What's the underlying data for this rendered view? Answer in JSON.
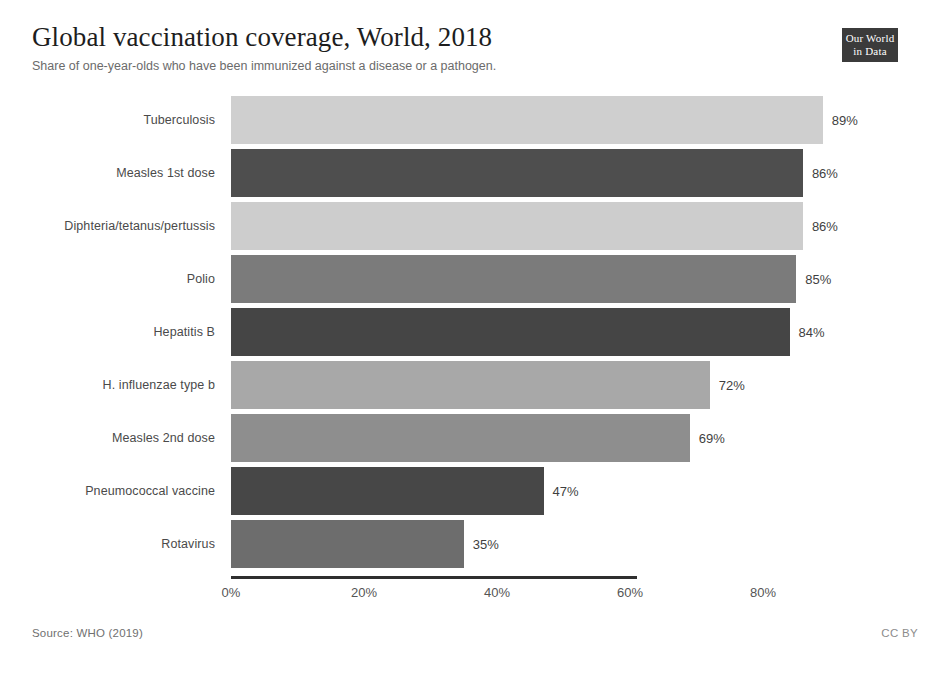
{
  "header": {
    "title": "Global vaccination coverage, World, 2018",
    "subtitle": "Share of one-year-olds who have been immunized against a disease or a pathogen."
  },
  "logo": {
    "line1": "Our World",
    "line2": "in Data"
  },
  "footer": {
    "source": "Source: WHO (2019)",
    "license": "CC BY"
  },
  "colors": {
    "bar_light": "#cfcfcf",
    "bar_dark": "#4e4e4e",
    "bar_mid": "#7b7b7b",
    "bar_darker": "#414141",
    "axis": "#2f2f2f",
    "logo_bg": "#3b3b3b"
  },
  "chart_data": {
    "type": "bar",
    "orientation": "horizontal",
    "title": "Global vaccination coverage, World, 2018",
    "subtitle": "Share of one-year-olds who have been immunized against a disease or a pathogen.",
    "xlabel": "",
    "ylabel": "",
    "xlim": [
      0,
      100
    ],
    "xticks": [
      0,
      20,
      40,
      60,
      80
    ],
    "xtick_labels": [
      "0%",
      "20%",
      "40%",
      "60%",
      "80%"
    ],
    "grid": false,
    "legend": false,
    "value_label_suffix": "%",
    "categories": [
      "Tuberculosis",
      "Measles 1st dose",
      "Diphteria/tetanus/pertussis",
      "Polio",
      "Hepatitis B",
      "H. influenzae type b",
      "Measles 2nd dose",
      "Pneumococcal vaccine",
      "Rotavirus"
    ],
    "values": [
      89,
      86,
      86,
      85,
      84,
      72,
      69,
      47,
      35
    ],
    "value_labels": [
      "89%",
      "86%",
      "86%",
      "85%",
      "84%",
      "72%",
      "69%",
      "47%",
      "35%"
    ],
    "bar_colors": [
      "#cfcfcf",
      "#4e4e4e",
      "#cdcdcd",
      "#7b7b7b",
      "#454545",
      "#a8a8a8",
      "#8e8e8e",
      "#474747",
      "#6d6d6d"
    ],
    "bars": [
      {
        "category": "Tuberculosis",
        "value": 89,
        "label": "89%",
        "color": "#cfcfcf"
      },
      {
        "category": "Measles 1st dose",
        "value": 86,
        "label": "86%",
        "color": "#4e4e4e"
      },
      {
        "category": "Diphteria/tetanus/pertussis",
        "value": 86,
        "label": "86%",
        "color": "#cdcdcd"
      },
      {
        "category": "Polio",
        "value": 85,
        "label": "85%",
        "color": "#7b7b7b"
      },
      {
        "category": "Hepatitis B",
        "value": 84,
        "label": "84%",
        "color": "#454545"
      },
      {
        "category": "H. influenzae type b",
        "value": 72,
        "label": "72%",
        "color": "#a8a8a8"
      },
      {
        "category": "Measles 2nd dose",
        "value": 69,
        "label": "69%",
        "color": "#8e8e8e"
      },
      {
        "category": "Pneumococcal vaccine",
        "value": 47,
        "label": "47%",
        "color": "#474747"
      },
      {
        "category": "Rotavirus",
        "value": 35,
        "label": "35%",
        "color": "#6d6d6d"
      }
    ]
  }
}
